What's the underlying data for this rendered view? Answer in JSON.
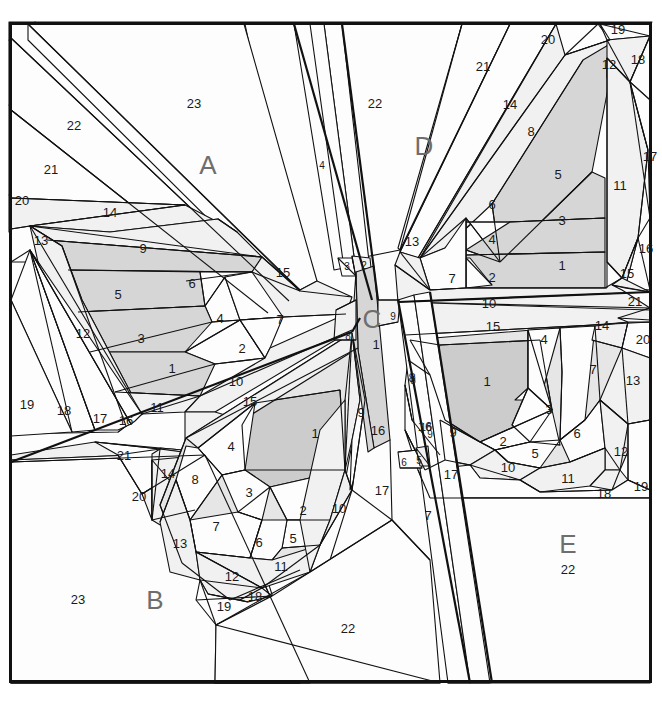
{
  "document": {
    "type": "foundation-paper-piecing-pattern",
    "subject": "butterfly",
    "background_color": "#ffffff",
    "line_color": "#111111",
    "section_label_color": "#6e6e6e",
    "frame": {
      "x": 9,
      "y": 22,
      "width": 643,
      "height": 661
    }
  },
  "sections": [
    {
      "id": "A",
      "label": "A",
      "x": 208,
      "y": 167
    },
    {
      "id": "B",
      "label": "B",
      "x": 155,
      "y": 602
    },
    {
      "id": "C",
      "label": "C",
      "x": 372,
      "y": 321
    },
    {
      "id": "D",
      "label": "D",
      "x": 424,
      "y": 148
    },
    {
      "id": "E",
      "label": "E",
      "x": 568,
      "y": 546
    }
  ],
  "section_pieces": {
    "A": [
      {
        "n": "1",
        "x": 172,
        "y": 370
      },
      {
        "n": "2",
        "x": 242,
        "y": 350
      },
      {
        "n": "3",
        "x": 141,
        "y": 340
      },
      {
        "n": "4",
        "x": 220,
        "y": 320
      },
      {
        "n": "5",
        "x": 118,
        "y": 296
      },
      {
        "n": "6",
        "x": 192,
        "y": 285
      },
      {
        "n": "7",
        "x": 280,
        "y": 321
      },
      {
        "n": "9",
        "x": 143,
        "y": 250
      },
      {
        "n": "10",
        "x": 236,
        "y": 383
      },
      {
        "n": "11",
        "x": 157,
        "y": 409
      },
      {
        "n": "12",
        "x": 83,
        "y": 335
      },
      {
        "n": "13",
        "x": 41,
        "y": 242
      },
      {
        "n": "14",
        "x": 110,
        "y": 214
      },
      {
        "n": "15",
        "x": 283,
        "y": 274
      },
      {
        "n": "16",
        "x": 126,
        "y": 422
      },
      {
        "n": "17",
        "x": 100,
        "y": 420
      },
      {
        "n": "18",
        "x": 64,
        "y": 412
      },
      {
        "n": "19",
        "x": 27,
        "y": 406
      },
      {
        "n": "20",
        "x": 22,
        "y": 202
      },
      {
        "n": "21",
        "x": 51,
        "y": 171
      },
      {
        "n": "22",
        "x": 74,
        "y": 127
      },
      {
        "n": "23",
        "x": 194,
        "y": 105
      }
    ],
    "B": [
      {
        "n": "1",
        "x": 315,
        "y": 435
      },
      {
        "n": "2",
        "x": 303,
        "y": 512
      },
      {
        "n": "3",
        "x": 249,
        "y": 494
      },
      {
        "n": "4",
        "x": 231,
        "y": 448
      },
      {
        "n": "5",
        "x": 293,
        "y": 540
      },
      {
        "n": "6",
        "x": 259,
        "y": 544
      },
      {
        "n": "7",
        "x": 216,
        "y": 528
      },
      {
        "n": "8",
        "x": 195,
        "y": 481
      },
      {
        "n": "9",
        "x": 361,
        "y": 414
      },
      {
        "n": "10",
        "x": 339,
        "y": 510
      },
      {
        "n": "11",
        "x": 281,
        "y": 568
      },
      {
        "n": "12",
        "x": 232,
        "y": 578
      },
      {
        "n": "13",
        "x": 180,
        "y": 545
      },
      {
        "n": "14",
        "x": 168,
        "y": 475
      },
      {
        "n": "15",
        "x": 250,
        "y": 403
      },
      {
        "n": "16",
        "x": 378,
        "y": 432
      },
      {
        "n": "17",
        "x": 382,
        "y": 492
      },
      {
        "n": "18",
        "x": 255,
        "y": 598
      },
      {
        "n": "19",
        "x": 224,
        "y": 608
      },
      {
        "n": "20",
        "x": 139,
        "y": 498
      },
      {
        "n": "21",
        "x": 124,
        "y": 457
      },
      {
        "n": "22",
        "x": 348,
        "y": 630
      },
      {
        "n": "23",
        "x": 78,
        "y": 601
      }
    ],
    "C": [
      {
        "n": "1",
        "x": 376,
        "y": 346
      },
      {
        "n": "2",
        "x": 364,
        "y": 266
      },
      {
        "n": "3",
        "x": 347,
        "y": 267
      },
      {
        "n": "4",
        "x": 322,
        "y": 166
      },
      {
        "n": "6",
        "x": 404,
        "y": 463
      },
      {
        "n": "5",
        "x": 419,
        "y": 461
      },
      {
        "n": "7",
        "x": 428,
        "y": 517
      },
      {
        "n": "8a",
        "x": 348,
        "y": 337
      },
      {
        "n": "9a",
        "x": 393,
        "y": 317
      },
      {
        "n": "8b",
        "x": 413,
        "y": 381
      },
      {
        "n": "9b",
        "x": 430,
        "y": 435
      },
      {
        "n": "16",
        "x": 426,
        "y": 428
      }
    ],
    "D": [
      {
        "n": "1",
        "x": 562,
        "y": 267
      },
      {
        "n": "2",
        "x": 492,
        "y": 279
      },
      {
        "n": "3",
        "x": 562,
        "y": 222
      },
      {
        "n": "4",
        "x": 492,
        "y": 241
      },
      {
        "n": "5",
        "x": 558,
        "y": 176
      },
      {
        "n": "6",
        "x": 492,
        "y": 206
      },
      {
        "n": "7",
        "x": 452,
        "y": 280
      },
      {
        "n": "8",
        "x": 531,
        "y": 133
      },
      {
        "n": "10",
        "x": 489,
        "y": 305
      },
      {
        "n": "11",
        "x": 620,
        "y": 187
      },
      {
        "n": "12",
        "x": 609,
        "y": 66
      },
      {
        "n": "13",
        "x": 412,
        "y": 243
      },
      {
        "n": "14",
        "x": 510,
        "y": 106
      },
      {
        "n": "15",
        "x": 627,
        "y": 275
      },
      {
        "n": "16",
        "x": 646,
        "y": 250
      },
      {
        "n": "17",
        "x": 650,
        "y": 158
      },
      {
        "n": "18",
        "x": 638,
        "y": 61
      },
      {
        "n": "19",
        "x": 618,
        "y": 31
      },
      {
        "n": "20",
        "x": 548,
        "y": 41
      },
      {
        "n": "21",
        "x": 483,
        "y": 68
      },
      {
        "n": "22",
        "x": 375,
        "y": 105
      }
    ],
    "E": [
      {
        "n": "1",
        "x": 487,
        "y": 383
      },
      {
        "n": "2",
        "x": 503,
        "y": 443
      },
      {
        "n": "3",
        "x": 549,
        "y": 411
      },
      {
        "n": "4",
        "x": 544,
        "y": 341
      },
      {
        "n": "5",
        "x": 535,
        "y": 455
      },
      {
        "n": "6",
        "x": 577,
        "y": 435
      },
      {
        "n": "7",
        "x": 593,
        "y": 371
      },
      {
        "n": "8",
        "x": 412,
        "y": 379
      },
      {
        "n": "9",
        "x": 453,
        "y": 434
      },
      {
        "n": "10",
        "x": 508,
        "y": 469
      },
      {
        "n": "11",
        "x": 568,
        "y": 480
      },
      {
        "n": "12",
        "x": 621,
        "y": 453
      },
      {
        "n": "13",
        "x": 633,
        "y": 382
      },
      {
        "n": "14",
        "x": 602,
        "y": 327
      },
      {
        "n": "15",
        "x": 493,
        "y": 328
      },
      {
        "n": "16",
        "x": 425,
        "y": 428
      },
      {
        "n": "17",
        "x": 451,
        "y": 476
      },
      {
        "n": "18",
        "x": 604,
        "y": 495
      },
      {
        "n": "19",
        "x": 641,
        "y": 488
      },
      {
        "n": "20",
        "x": 643,
        "y": 341
      },
      {
        "n": "21",
        "x": 635,
        "y": 303
      },
      {
        "n": "22",
        "x": 568,
        "y": 571
      }
    ]
  },
  "colors": {
    "white": "#fdfdfd",
    "light_1": "#f1f1f1",
    "light_2": "#e6e6e6",
    "mid_1": "#d6d6d6",
    "mid_2": "#cccccc",
    "stroke": "#111111",
    "label": "#6e6e6e"
  }
}
